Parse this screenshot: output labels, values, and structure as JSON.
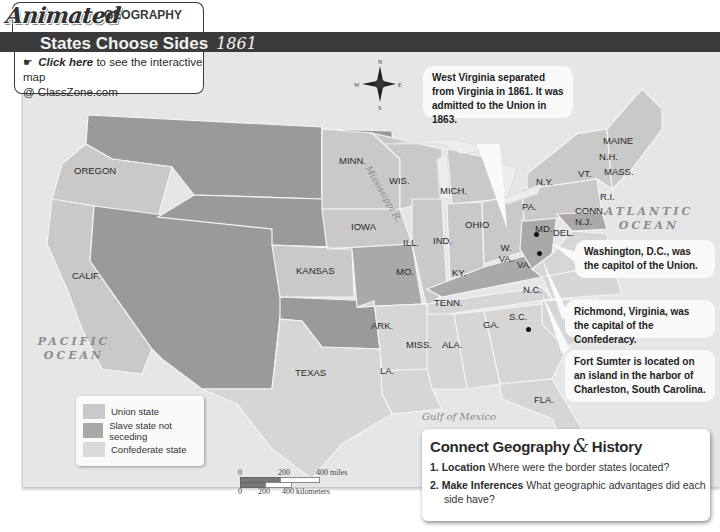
{
  "header": {
    "brand": "Animated",
    "subbrand": "GEOGRAPHY",
    "title": "States Choose Sides",
    "year": "1861",
    "link_icon": "mouse-click-icon",
    "link_label": "Click here",
    "link_text": "to see the interactive map",
    "link_site": "@ ClassZone.com"
  },
  "colors": {
    "union": "#c9c9c9",
    "border_slave": "#a9a9a9",
    "confederate": "#d6d6d6",
    "territory": "#9a9a9a",
    "water": "#e6e6e6",
    "title_bar": "#3b3b3b"
  },
  "compass": {
    "n": "N",
    "s": "S",
    "e": "E",
    "w": "W"
  },
  "states": [
    {
      "label": "OREGON",
      "status": "union"
    },
    {
      "label": "CALIF.",
      "status": "union"
    },
    {
      "label": "MINN.",
      "status": "union"
    },
    {
      "label": "WIS.",
      "status": "union"
    },
    {
      "label": "IOWA",
      "status": "union"
    },
    {
      "label": "KANSAS",
      "status": "union"
    },
    {
      "label": "MICH.",
      "status": "union"
    },
    {
      "label": "ILL.",
      "status": "union"
    },
    {
      "label": "IND.",
      "status": "union"
    },
    {
      "label": "OHIO",
      "status": "union"
    },
    {
      "label": "PA.",
      "status": "union"
    },
    {
      "label": "N.Y.",
      "status": "union"
    },
    {
      "label": "VT.",
      "status": "union"
    },
    {
      "label": "MAINE",
      "status": "union"
    },
    {
      "label": "N.H.",
      "status": "union"
    },
    {
      "label": "MASS.",
      "status": "union"
    },
    {
      "label": "R.I.",
      "status": "union"
    },
    {
      "label": "CONN.",
      "status": "union"
    },
    {
      "label": "N.J.",
      "status": "union"
    },
    {
      "label": "MO.",
      "status": "slave state not seceding"
    },
    {
      "label": "KY.",
      "status": "slave state not seceding"
    },
    {
      "label": "W. VA.",
      "status": "slave state not seceding"
    },
    {
      "label": "MD.",
      "status": "slave state not seceding"
    },
    {
      "label": "DEL.",
      "status": "slave state not seceding"
    },
    {
      "label": "VA.",
      "status": "confederate"
    },
    {
      "label": "N.C.",
      "status": "confederate"
    },
    {
      "label": "TENN.",
      "status": "confederate"
    },
    {
      "label": "S.C.",
      "status": "confederate"
    },
    {
      "label": "GA.",
      "status": "confederate"
    },
    {
      "label": "ALA.",
      "status": "confederate"
    },
    {
      "label": "MISS.",
      "status": "confederate"
    },
    {
      "label": "ARK.",
      "status": "confederate"
    },
    {
      "label": "LA.",
      "status": "confederate"
    },
    {
      "label": "TEXAS",
      "status": "confederate"
    },
    {
      "label": "FLA.",
      "status": "confederate"
    }
  ],
  "water_labels": {
    "pacific": "PACIFIC OCEAN",
    "atlantic": "ATLANTIC OCEAN",
    "gulf": "Gulf of Mexico",
    "river": "Mississippi R."
  },
  "callouts": {
    "west_virginia": "West Virginia separated from Virginia in 1861. It was admitted to the Union in 1863.",
    "washington": "Washington, D.C., was the capitol of the Union.",
    "richmond": "Richmond, Virginia, was the capital of the Confederacy.",
    "fort_sumter": "Fort Sumter is located on an island in the harbor of Charleston, South Carolina."
  },
  "legend": {
    "items": [
      {
        "label": "Union state"
      },
      {
        "label": "Slave state not seceding"
      },
      {
        "label": "Confederate state"
      }
    ]
  },
  "scale": {
    "miles": [
      "0",
      "200",
      "400 miles"
    ],
    "km": [
      "0",
      "200",
      "400 kilometers"
    ]
  },
  "connect": {
    "title_left": "Connect Geography",
    "amp": "&",
    "title_right": "History",
    "questions": [
      {
        "num": "1.",
        "label": "Location",
        "text": "Where were the border states located?"
      },
      {
        "num": "2.",
        "label": "Make Inferences",
        "text": "What geographic advantages did each side have?"
      }
    ]
  }
}
